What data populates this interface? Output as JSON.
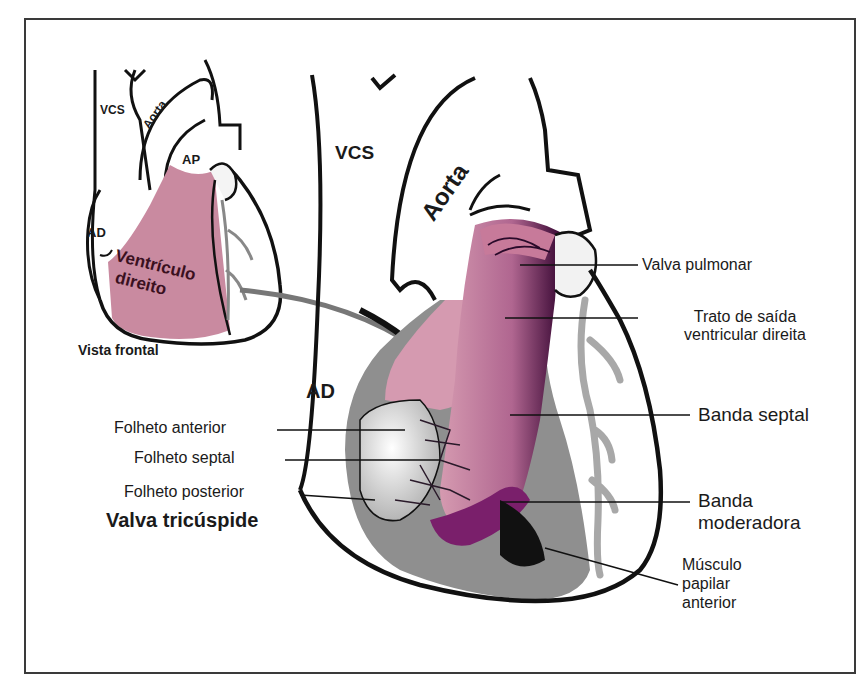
{
  "figure": {
    "colors": {
      "outline": "#111111",
      "rv_pink": "#c98aa0",
      "rv_deep": "#7a1f6b",
      "myocardium_gray": "#8a8a8a",
      "vessel_gray": "#a8a8a8",
      "frame": "#3a3a3a"
    },
    "small_heart": {
      "caption": "Vista frontal",
      "labels": {
        "vcs": "VCS",
        "aorta": "Aorta",
        "ap": "AP",
        "ad": "AD",
        "rv_line1": "Ventrículo",
        "rv_line2": "direito"
      }
    },
    "large_heart": {
      "labels": {
        "vcs": "VCS",
        "aorta": "Aorta",
        "ad": "AD"
      },
      "callouts_right": [
        {
          "text": "Valva pulmonar"
        },
        {
          "text_line1": "Trato de saída",
          "text_line2": "ventricular direita"
        },
        {
          "text": "Banda septal"
        },
        {
          "text_line1": "Banda",
          "text_line2": "moderadora"
        },
        {
          "text_line1": "Músculo",
          "text_line2": "papilar",
          "text_line3": "anterior"
        }
      ],
      "callouts_left": [
        {
          "text": "Folheto anterior"
        },
        {
          "text": "Folheto septal"
        },
        {
          "text": "Folheto posterior"
        }
      ],
      "valve_title": "Valva tricúspide"
    }
  }
}
